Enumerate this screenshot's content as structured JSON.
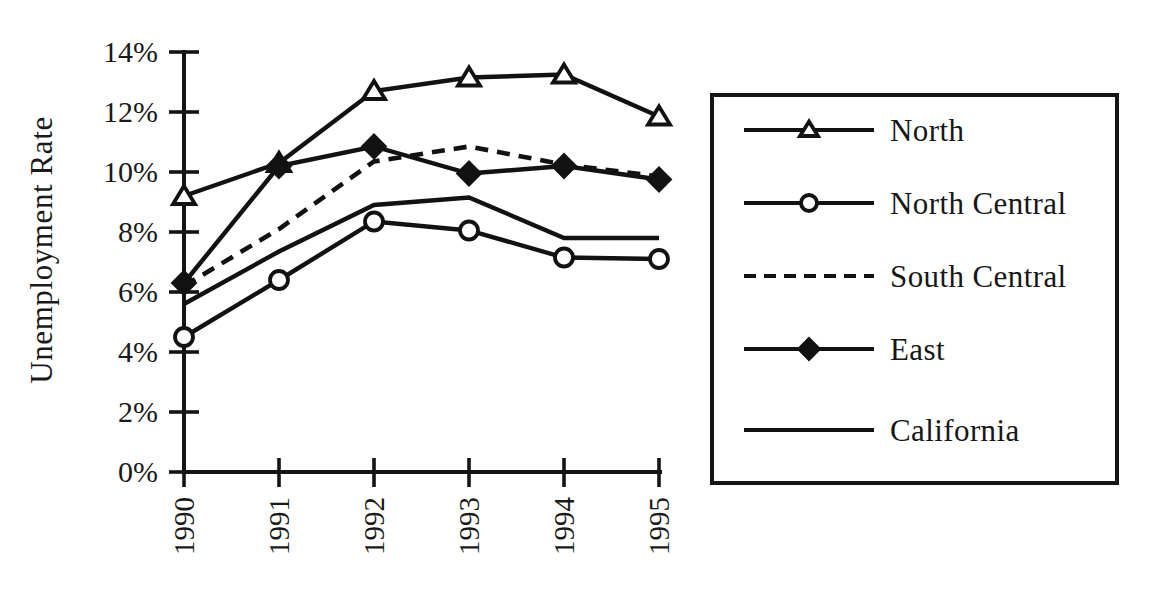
{
  "chart_data": {
    "type": "line",
    "title": "",
    "xlabel": "",
    "ylabel": "Unemployment Rate",
    "x": [
      "1990",
      "1991",
      "1992",
      "1993",
      "1994",
      "1995"
    ],
    "categories": [
      "1990",
      "1991",
      "1992",
      "1993",
      "1994",
      "1995"
    ],
    "ylim": [
      0,
      14
    ],
    "ytick_labels": [
      "0%",
      "2%",
      "4%",
      "6%",
      "8%",
      "10%",
      "12%",
      "14%"
    ],
    "ytick_values": [
      0,
      2,
      4,
      6,
      8,
      10,
      12,
      14
    ],
    "grid": false,
    "legend_position": "right-outside",
    "series": [
      {
        "name": "North",
        "marker": "open-triangle",
        "linestyle": "solid",
        "values": [
          9.2,
          10.3,
          12.7,
          13.15,
          13.25,
          11.85
        ]
      },
      {
        "name": "North Central",
        "marker": "open-circle",
        "linestyle": "solid",
        "values": [
          4.5,
          6.4,
          8.35,
          8.05,
          7.15,
          7.1
        ]
      },
      {
        "name": "South Central",
        "marker": "none",
        "linestyle": "dashed",
        "values": [
          6.2,
          8.1,
          10.35,
          10.85,
          10.25,
          9.85
        ]
      },
      {
        "name": "East",
        "marker": "filled-diamond",
        "linestyle": "solid",
        "values": [
          6.3,
          10.2,
          10.85,
          9.95,
          10.2,
          9.75
        ]
      },
      {
        "name": "California",
        "marker": "none",
        "linestyle": "solid",
        "values": [
          5.6,
          7.35,
          8.9,
          9.15,
          7.8,
          7.8
        ]
      }
    ]
  },
  "axes": {
    "y_title": "Unemployment Rate",
    "y_ticks": [
      {
        "label": "14%",
        "value": 14
      },
      {
        "label": "12%",
        "value": 12
      },
      {
        "label": "10%",
        "value": 10
      },
      {
        "label": "8%",
        "value": 8
      },
      {
        "label": "6%",
        "value": 6
      },
      {
        "label": "4%",
        "value": 4
      },
      {
        "label": "2%",
        "value": 2
      },
      {
        "label": "0%",
        "value": 0
      }
    ],
    "x_ticks": [
      {
        "label": "1990"
      },
      {
        "label": "1991"
      },
      {
        "label": "1992"
      },
      {
        "label": "1993"
      },
      {
        "label": "1994"
      },
      {
        "label": "1995"
      }
    ]
  },
  "legend": {
    "entries": [
      {
        "label": "North",
        "marker": "open-triangle",
        "linestyle": "solid"
      },
      {
        "label": "North Central",
        "marker": "open-circle",
        "linestyle": "solid"
      },
      {
        "label": "South Central",
        "marker": "none",
        "linestyle": "dashed"
      },
      {
        "label": "East",
        "marker": "filled-diamond",
        "linestyle": "solid"
      },
      {
        "label": "California",
        "marker": "none",
        "linestyle": "solid"
      }
    ]
  },
  "colors": {
    "ink": "#121212",
    "background": "#ffffff"
  }
}
